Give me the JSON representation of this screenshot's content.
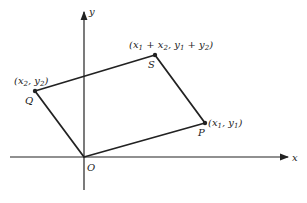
{
  "diagram": {
    "type": "parallelogram-vector-addition",
    "axes": {
      "x_label": "x",
      "y_label": "y",
      "origin_label": "O"
    },
    "points": {
      "O": {
        "label": "O",
        "coords": ""
      },
      "P": {
        "label": "P",
        "coords": "(x1, y1)",
        "coords_parts": [
          "(x",
          "1",
          ", y",
          "1",
          ")"
        ]
      },
      "Q": {
        "label": "Q",
        "coords": "(x2, y2)",
        "coords_parts": [
          "(x",
          "2",
          ", y",
          "2",
          ")"
        ]
      },
      "S": {
        "label": "S",
        "coords": "(x1 + x2, y1 + y2)",
        "coords_parts": [
          "(x",
          "1",
          " + x",
          "2",
          ", y",
          "1",
          " + y",
          "2",
          ")"
        ]
      }
    },
    "edges": [
      "O-P",
      "P-S",
      "S-Q",
      "Q-O"
    ],
    "colors": {
      "line": "#222222",
      "background": "#ffffff"
    }
  }
}
